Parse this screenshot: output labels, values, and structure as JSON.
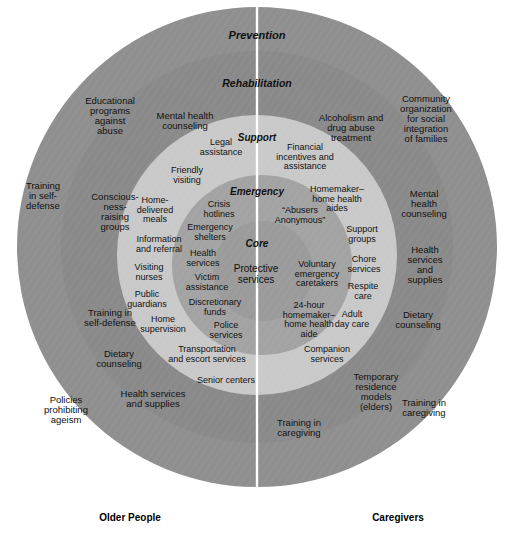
{
  "diagram": {
    "colors": {
      "prevention_ring": "#8f8f8f",
      "rehabilitation_ring": "#8a8a8a",
      "support_ring": "#c9c9c9",
      "emergency_ring": "#a3a3a3",
      "core_circle": "#9b9b9b",
      "divider": "#ffffff",
      "background": "#ffffff",
      "text": "#111111"
    },
    "divider": {
      "name": "vertical-divider",
      "color": "#ffffff"
    },
    "ring_headings": [
      {
        "label": "Prevention",
        "cx": 257,
        "cy": 35,
        "size": 11
      },
      {
        "label": "Rehabilitation",
        "cx": 257,
        "cy": 83,
        "size": 10.5
      },
      {
        "label": "Support",
        "cx": 257,
        "cy": 137,
        "size": 10
      },
      {
        "label": "Emergency",
        "cx": 257,
        "cy": 191,
        "size": 10
      },
      {
        "label": "Core",
        "cx": 257,
        "cy": 243,
        "size": 10
      }
    ],
    "side_labels": [
      {
        "label": "Older People",
        "cx": 130,
        "cy": 517
      },
      {
        "label": "Caregivers",
        "cx": 398,
        "cy": 517
      }
    ],
    "services": [
      {
        "label": "Educational\nprograms\nagainst\nabuse",
        "cx": 110,
        "cy": 116,
        "size": 9.5,
        "ring": "prevention",
        "side": "older-people"
      },
      {
        "label": "Mental health\ncounseling",
        "cx": 185,
        "cy": 121,
        "size": 9.5,
        "ring": "rehabilitation",
        "side": "older-people"
      },
      {
        "label": "Training\nin self-\ndefense",
        "cx": 43,
        "cy": 196,
        "size": 9.5,
        "ring": "prevention",
        "side": "older-people"
      },
      {
        "label": "Conscious-\nness-\nraising\ngroups",
        "cx": 115,
        "cy": 212,
        "size": 9.5,
        "ring": "rehabilitation",
        "side": "older-people"
      },
      {
        "label": "Training in\nself-defense",
        "cx": 110,
        "cy": 318,
        "size": 9.5,
        "ring": "rehabilitation",
        "side": "older-people"
      },
      {
        "label": "Dietary\ncounseling",
        "cx": 119,
        "cy": 359,
        "size": 9.5,
        "ring": "rehabilitation",
        "side": "older-people"
      },
      {
        "label": "Health services\nand supplies",
        "cx": 153,
        "cy": 399,
        "size": 9.5,
        "ring": "rehabilitation",
        "side": "older-people"
      },
      {
        "label": "Policies\nprohibiting\nageism",
        "cx": 66,
        "cy": 410,
        "size": 9.5,
        "ring": "prevention",
        "side": "older-people"
      },
      {
        "label": "Legal\nassistance",
        "cx": 221,
        "cy": 148,
        "size": 9,
        "ring": "support",
        "side": "older-people"
      },
      {
        "label": "Friendly\nvisiting",
        "cx": 187,
        "cy": 176,
        "size": 9,
        "ring": "support",
        "side": "older-people"
      },
      {
        "label": "Home-\ndelivered\nmeals",
        "cx": 155,
        "cy": 210,
        "size": 9,
        "ring": "support",
        "side": "older-people"
      },
      {
        "label": "Information\nand referral",
        "cx": 159,
        "cy": 245,
        "size": 9,
        "ring": "support",
        "side": "older-people"
      },
      {
        "label": "Visiting\nnurses",
        "cx": 149,
        "cy": 273,
        "size": 9,
        "ring": "support",
        "side": "older-people"
      },
      {
        "label": "Public\nguardians",
        "cx": 147,
        "cy": 300,
        "size": 9,
        "ring": "support",
        "side": "older-people"
      },
      {
        "label": "Home\nsupervision",
        "cx": 163,
        "cy": 325,
        "size": 9,
        "ring": "support",
        "side": "older-people"
      },
      {
        "label": "Transportation\nand escort services",
        "cx": 207,
        "cy": 355,
        "size": 9,
        "ring": "support",
        "side": "older-people"
      },
      {
        "label": "Senior centers",
        "cx": 226,
        "cy": 381,
        "size": 9,
        "ring": "support",
        "side": "older-people"
      },
      {
        "label": "Crisis\nhotlines",
        "cx": 219,
        "cy": 210,
        "size": 9,
        "ring": "emergency",
        "side": "older-people"
      },
      {
        "label": "Emergency\nshelters",
        "cx": 210,
        "cy": 233,
        "size": 9,
        "ring": "emergency",
        "side": "older-people"
      },
      {
        "label": "Health\nservices",
        "cx": 203,
        "cy": 259,
        "size": 9,
        "ring": "emergency",
        "side": "older-people"
      },
      {
        "label": "Victim\nassistance",
        "cx": 207,
        "cy": 283,
        "size": 9,
        "ring": "emergency",
        "side": "older-people"
      },
      {
        "label": "Discretionary\nfunds",
        "cx": 215,
        "cy": 308,
        "size": 9,
        "ring": "emergency",
        "side": "older-people"
      },
      {
        "label": "Police\nservices",
        "cx": 226,
        "cy": 331,
        "size": 9,
        "ring": "emergency",
        "side": "older-people"
      },
      {
        "label": "Protective\nservices",
        "cx": 256,
        "cy": 275,
        "size": 10,
        "ring": "core",
        "side": "both"
      },
      {
        "label": "Community\norganization\nfor social\nintegration\nof families",
        "cx": 426,
        "cy": 119,
        "size": 9.5,
        "ring": "prevention",
        "side": "caregivers"
      },
      {
        "label": "Alcoholism and\ndrug abuse\ntreatment",
        "cx": 351,
        "cy": 128,
        "size": 9.5,
        "ring": "rehabilitation",
        "side": "caregivers"
      },
      {
        "label": "Mental\nhealth\ncounseling",
        "cx": 424,
        "cy": 204,
        "size": 9.5,
        "ring": "rehabilitation",
        "side": "caregivers"
      },
      {
        "label": "Health\nservices\nand\nsupplies",
        "cx": 425,
        "cy": 265,
        "size": 9.5,
        "ring": "rehabilitation",
        "side": "caregivers"
      },
      {
        "label": "Dietary\ncounseling",
        "cx": 418,
        "cy": 320,
        "size": 9.5,
        "ring": "rehabilitation",
        "side": "caregivers"
      },
      {
        "label": "Training in\ncaregiving",
        "cx": 424,
        "cy": 408,
        "size": 9.5,
        "ring": "prevention",
        "side": "caregivers"
      },
      {
        "label": "Financial\nincentives and\nassistance",
        "cx": 305,
        "cy": 157,
        "size": 9,
        "ring": "support",
        "side": "caregivers"
      },
      {
        "label": "Homemaker–\nhome health\naides",
        "cx": 337,
        "cy": 199,
        "size": 9,
        "ring": "support",
        "side": "caregivers"
      },
      {
        "label": "Support\ngroups",
        "cx": 362,
        "cy": 235,
        "size": 9,
        "ring": "support",
        "side": "caregivers"
      },
      {
        "label": "Chore\nservices",
        "cx": 364,
        "cy": 265,
        "size": 9,
        "ring": "support",
        "side": "caregivers"
      },
      {
        "label": "Respite\ncare",
        "cx": 363,
        "cy": 292,
        "size": 9,
        "ring": "support",
        "side": "caregivers"
      },
      {
        "label": "Adult\nday care",
        "cx": 352,
        "cy": 320,
        "size": 9,
        "ring": "support",
        "side": "caregivers"
      },
      {
        "label": "Companion\nservices",
        "cx": 327,
        "cy": 355,
        "size": 9,
        "ring": "support",
        "side": "caregivers"
      },
      {
        "label": "Temporary\nresidence\nmodels\n(elders)",
        "cx": 376,
        "cy": 392,
        "size": 9.5,
        "ring": "rehabilitation",
        "side": "caregivers"
      },
      {
        "label": "“Abusers\nAnonymous”",
        "cx": 300,
        "cy": 216,
        "size": 9,
        "ring": "emergency",
        "side": "caregivers"
      },
      {
        "label": "Voluntary\nemergency\ncaretakers",
        "cx": 317,
        "cy": 274,
        "size": 9,
        "ring": "emergency",
        "side": "caregivers"
      },
      {
        "label": "24-hour\nhomemaker–\nhome health\naide",
        "cx": 309,
        "cy": 320,
        "size": 9,
        "ring": "emergency",
        "side": "caregivers"
      },
      {
        "label": "Training in\ncaregiving",
        "cx": 299,
        "cy": 428,
        "size": 9.5,
        "ring": "rehabilitation",
        "side": "caregivers"
      }
    ]
  }
}
